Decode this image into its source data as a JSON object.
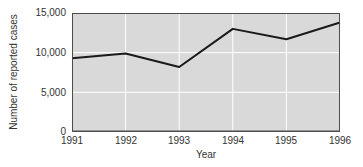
{
  "chart_data": {
    "type": "line",
    "title": "",
    "xlabel": "Year",
    "ylabel": "Number of reported cases",
    "categories": [
      1991,
      1992,
      1993,
      1994,
      1995,
      1996
    ],
    "values": [
      9300,
      9900,
      8200,
      13000,
      11700,
      13800
    ],
    "ylim": [
      0,
      15000
    ],
    "yticks": [
      0,
      5000,
      10000,
      15000
    ],
    "ytick_labels": [
      "0",
      "5,000",
      "10,000",
      "15,000"
    ],
    "grid": true,
    "gridline_values_y": [
      5000,
      10000
    ],
    "gridline_x_at_categories": [
      1992,
      1993,
      1994,
      1995,
      1996
    ],
    "legend_position": "none",
    "colors": {
      "page_background": "#ffffff",
      "plot_background": "#d9d9d9",
      "gridline": "#ffffff",
      "line": "#1a1a1a",
      "frame": "#4d4d4d",
      "text": "#333333"
    }
  }
}
